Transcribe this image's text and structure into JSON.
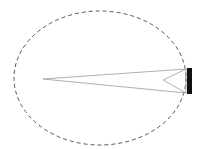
{
  "diagram": {
    "background": "#ffffff",
    "boundary": {
      "shape": "ellipse",
      "cx": 100,
      "cy": 78,
      "rx": 86,
      "ry": 67,
      "stroke": "#555555",
      "dash": "4 3"
    },
    "beam": {
      "apex": [
        43,
        79
      ],
      "top": [
        186,
        69
      ],
      "bottom": [
        186,
        93
      ],
      "stroke": "#9a9a9a"
    },
    "inner_wedge": {
      "vertex": [
        163,
        80
      ],
      "top": [
        186,
        69
      ],
      "bottom": [
        186,
        93
      ],
      "stroke": "#9a9a9a"
    },
    "source_block": {
      "x": 187,
      "y": 68,
      "width": 5,
      "height": 26,
      "fill": "#111111"
    }
  }
}
